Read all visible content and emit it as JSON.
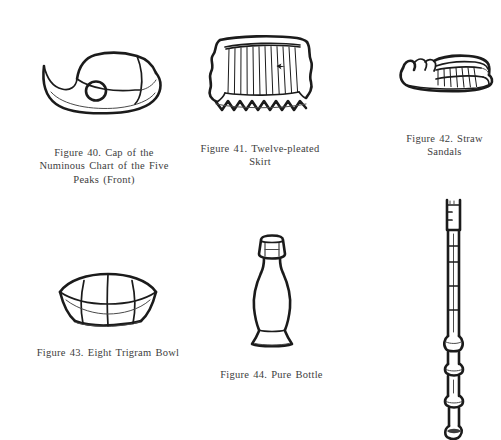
{
  "page": {
    "background_color": "#ffffff",
    "ink_color": "#1b1b1b",
    "text_color": "#3d3d3d",
    "running_head_fragment": ""
  },
  "figures": [
    {
      "id": "fig40",
      "number": "Figure 40.",
      "caption": "Figure 40. Cap of the Numinous Chart of the Five Peaks (Front)",
      "caption_lines": [
        "Figure 40. Cap of the",
        "Numinous Chart of the Five",
        "Peaks (Front)"
      ],
      "illustration_name": "cap-line-drawing"
    },
    {
      "id": "fig41",
      "number": "Figure 41.",
      "caption": "Figure 41. Twelve-pleated Skirt",
      "caption_lines": [
        "Figure 41. Twelve-pleated",
        "Skirt"
      ],
      "illustration_name": "pleated-skirt-line-drawing",
      "pleat_count": 12
    },
    {
      "id": "fig42",
      "number": "Figure 42.",
      "caption": "Figure 42. Straw Sandals",
      "caption_lines": [
        "Figure 42. Straw",
        "Sandals"
      ],
      "illustration_name": "straw-sandals-line-drawing"
    },
    {
      "id": "fig43",
      "number": "Figure 43.",
      "caption": "Figure 43. Eight Trigram Bowl",
      "caption_lines": [
        "Figure 43. Eight Trigram Bowl"
      ],
      "illustration_name": "eight-trigram-bowl-line-drawing"
    },
    {
      "id": "fig44",
      "number": "Figure 44.",
      "caption": "Figure 44. Pure Bottle",
      "caption_lines": [
        "Figure 44. Pure Bottle"
      ],
      "illustration_name": "pure-bottle-line-drawing"
    },
    {
      "id": "figstaff",
      "number": "",
      "caption": "",
      "caption_lines": [],
      "illustration_name": "ritual-staff-line-drawing"
    }
  ]
}
